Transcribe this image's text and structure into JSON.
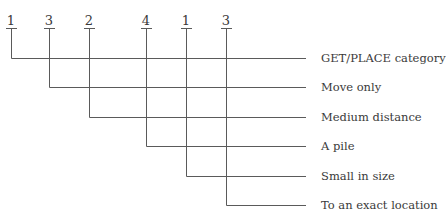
{
  "code": {
    "digits": [
      "1",
      "3",
      "2",
      "4",
      "1",
      "3"
    ]
  },
  "labels": [
    "GET/PLACE category",
    "Move only",
    "Medium distance",
    "A pile",
    "Small in size",
    "To an exact location"
  ],
  "colors": {
    "line": "#555555",
    "text": "#3a3a3a"
  }
}
